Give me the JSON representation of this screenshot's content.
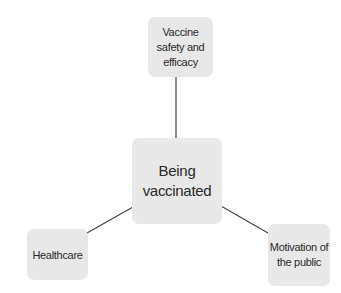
{
  "diagram": {
    "type": "hub-and-spoke",
    "center": {
      "id": "center",
      "label": "Being vaccinated"
    },
    "nodes": [
      {
        "id": "top",
        "label": "Vaccine safety and efficacy"
      },
      {
        "id": "left",
        "label": "Healthcare"
      },
      {
        "id": "right",
        "label": "Motivation of the public"
      }
    ],
    "edges": [
      {
        "from": "center",
        "to": "top"
      },
      {
        "from": "center",
        "to": "left"
      },
      {
        "from": "center",
        "to": "right"
      }
    ],
    "colors": {
      "node_fill": "#e8e8e8",
      "line": "#444444",
      "text": "#2a2a2a",
      "background": "#ffffff"
    }
  }
}
